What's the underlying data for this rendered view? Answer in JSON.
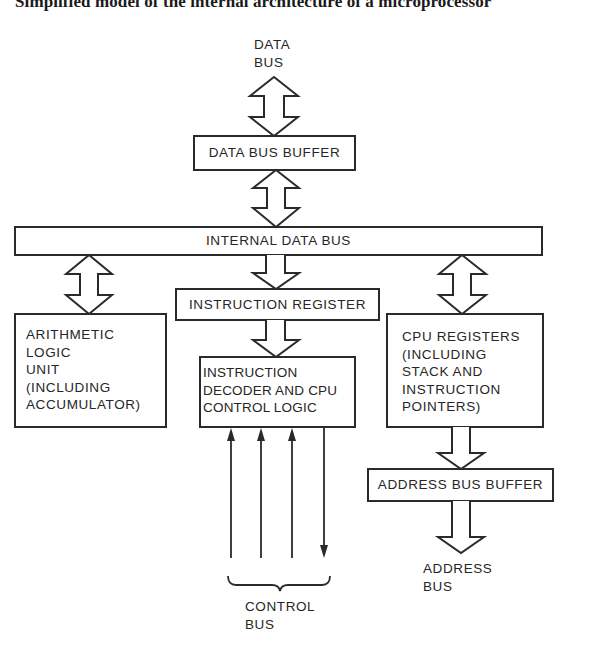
{
  "title": "Simplified model of the internal architecture of a microprocessor",
  "external": {
    "data_bus": "DATA\nBUS",
    "address_bus": "ADDRESS\nBUS",
    "control_bus": "CONTROL\nBUS"
  },
  "blocks": {
    "data_bus_buffer": "DATA BUS BUFFER",
    "internal_data_bus": "INTERNAL DATA BUS",
    "alu": "ARITHMETIC\nLOGIC\nUNIT\n(INCLUDING\nACCUMULATOR)",
    "instruction_register": "INSTRUCTION REGISTER",
    "instruction_decoder": "INSTRUCTION\nDECODER AND CPU\nCONTROL LOGIC",
    "cpu_registers": "CPU REGISTERS\n(INCLUDING\nSTACK AND\nINSTRUCTION\nPOINTERS)",
    "address_bus_buffer": "ADDRESS BUS BUFFER"
  },
  "connections": [
    {
      "from": "data_bus",
      "to": "data_bus_buffer",
      "type": "bidirectional"
    },
    {
      "from": "data_bus_buffer",
      "to": "internal_data_bus",
      "type": "bidirectional"
    },
    {
      "from": "internal_data_bus",
      "to": "alu",
      "type": "bidirectional"
    },
    {
      "from": "internal_data_bus",
      "to": "instruction_register",
      "type": "unidirectional"
    },
    {
      "from": "internal_data_bus",
      "to": "cpu_registers",
      "type": "bidirectional"
    },
    {
      "from": "instruction_register",
      "to": "instruction_decoder",
      "type": "unidirectional"
    },
    {
      "from": "cpu_registers",
      "to": "address_bus_buffer",
      "type": "unidirectional"
    },
    {
      "from": "address_bus_buffer",
      "to": "address_bus",
      "type": "unidirectional"
    },
    {
      "from": "control_bus",
      "to": "instruction_decoder",
      "type": "signal-line",
      "count": 3
    },
    {
      "from": "instruction_decoder",
      "to": "control_bus",
      "type": "signal-line",
      "count": 1
    }
  ]
}
